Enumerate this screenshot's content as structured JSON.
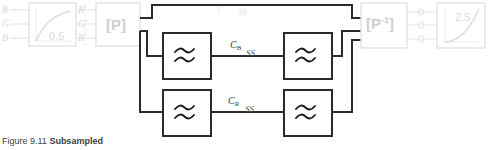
{
  "figure": {
    "caption_prefix": "Figure 9.11",
    "caption_title": "Subsampled",
    "caption_full": "Figure 9.11 Subsampled"
  },
  "colors": {
    "faint_gray": "#d8d8d8",
    "mid_gray": "#cfcfcf",
    "dark_line": "#2b2b2b",
    "box_border_light": "#e2e2e2",
    "text_dark": "#3a3a3a",
    "background": "#ffffff"
  },
  "inputs": {
    "label_r": "R",
    "label_g": "G",
    "label_b": "B"
  },
  "gamma_encode_block": {
    "name": "gamma-correction",
    "exponent_label": "0.5",
    "curve_type": "concave-power-curve"
  },
  "primed_signals": {
    "label_r": "R'",
    "label_g": "G'",
    "label_b": "B'"
  },
  "matrix_block": {
    "label": "[P]",
    "name": "color-matrix-forward"
  },
  "luma": {
    "label": "Y'",
    "ss_mark": "SS"
  },
  "filters": {
    "symbol": "≈",
    "cb_filter_in_name": "lowpass-filter-cb-input",
    "cr_filter_in_name": "lowpass-filter-cr-input",
    "cb_filter_out_name": "lowpass-filter-cb-output",
    "cr_filter_out_name": "lowpass-filter-cr-output"
  },
  "chroma": {
    "cb_label": "C",
    "cb_sub": "B",
    "cr_label": "C",
    "cr_sub": "R",
    "ss_mark": "SS"
  },
  "inverse_matrix_block": {
    "label_base": "[P",
    "label_exp": "-1",
    "label_close": "]",
    "label": "[P-1]",
    "name": "color-matrix-inverse"
  },
  "output_signals": {
    "label_r": "R'",
    "label_g": "G'",
    "label_b": "B'"
  },
  "gamma_decode_block": {
    "name": "gamma-expansion",
    "exponent_label": "2.5",
    "curve_type": "convex-power-curve"
  }
}
